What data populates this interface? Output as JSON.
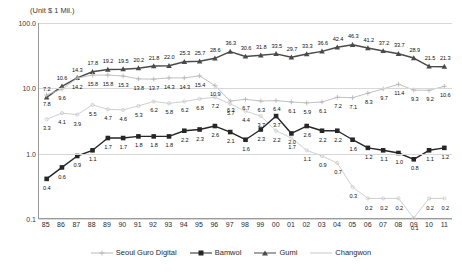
{
  "unit_note": "(Unit $ 1 Mil.)",
  "axis": {
    "y_ticks": [
      "100.0",
      "10.0",
      "1.0",
      "0.1"
    ],
    "y_min": 0.1,
    "y_max": 100.0
  },
  "legend": {
    "items": [
      {
        "label": "Seoul Guro Digital",
        "key": "seoul",
        "color": "#b9b9b9",
        "marker": "cross"
      },
      {
        "label": "Bamwol",
        "key": "bamwol",
        "color": "#262626",
        "marker": "square"
      },
      {
        "label": "Gumi",
        "key": "gumi",
        "color": "#4a4a4a",
        "marker": "triangle"
      },
      {
        "label": "Changwon",
        "key": "changwon",
        "color": "#c9c9c9",
        "marker": "line"
      }
    ]
  },
  "chart_data": {
    "type": "line",
    "title": "",
    "subtitle": "",
    "xlabel": "",
    "ylabel": "",
    "yscale": "log",
    "ylim": [
      0.1,
      100.0
    ],
    "grid": true,
    "legend_position": "bottom",
    "annotations": [
      "(Unit $ 1 Mil.)"
    ],
    "categories": [
      "85",
      "86",
      "87",
      "88",
      "89",
      "90",
      "91",
      "92",
      "93",
      "94",
      "95",
      "96",
      "97",
      "98",
      "99",
      "00",
      "01",
      "02",
      "03",
      "04",
      "05",
      "06",
      "07",
      "08",
      "09",
      "10",
      "11"
    ],
    "series": [
      {
        "name": "Gumi",
        "color": "#4a4a4a",
        "values": [
          7.2,
          10.6,
          14.3,
          17.8,
          19.2,
          19.5,
          20.2,
          21.8,
          22.0,
          25.3,
          25.7,
          28.6,
          36.3,
          30.6,
          31.8,
          33.5,
          29.7,
          33.3,
          36.6,
          42.4,
          46.3,
          41.2,
          37.2,
          33.7,
          28.9,
          21.5,
          21.3
        ]
      },
      {
        "name": "Seoul Guro Digital",
        "color": "#b9b9b9",
        "values": [
          7.8,
          9.6,
          14.2,
          15.8,
          15.8,
          15.3,
          13.8,
          13.7,
          14.3,
          14.3,
          15.4,
          10.9,
          6.3,
          6.7,
          6.3,
          6.4,
          6.1,
          5.9,
          6.1,
          7.2,
          7.1,
          8.3,
          9.7,
          11.4,
          9.3,
          9.2,
          10.6
        ]
      },
      {
        "name": "Changwon",
        "color": "#c9c9c9",
        "values": [
          3.3,
          4.1,
          3.9,
          5.5,
          4.7,
          4.6,
          5.3,
          6.2,
          5.8,
          6.2,
          6.8,
          7.2,
          5.7,
          4.4,
          3.7,
          2.2,
          1.7,
          1.1,
          0.9,
          0.7,
          0.3,
          0.2,
          0.2,
          0.2,
          0.1,
          0.2,
          0.2
        ]
      },
      {
        "name": "Bamwol",
        "color": "#262626",
        "values": [
          0.4,
          0.6,
          0.9,
          1.1,
          1.7,
          1.7,
          1.8,
          1.8,
          1.8,
          2.2,
          2.3,
          2.6,
          2.1,
          1.6,
          2.3,
          3.7,
          2.0,
          2.6,
          2.2,
          2.2,
          1.6,
          1.2,
          1.1,
          1.0,
          0.8,
          1.1,
          1.2
        ]
      }
    ]
  }
}
